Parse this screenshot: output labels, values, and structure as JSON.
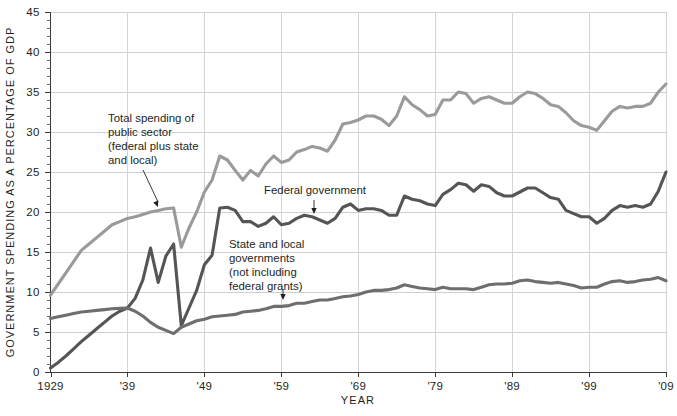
{
  "chart_data": {
    "type": "line",
    "title": "",
    "xlabel": "YEAR",
    "ylabel": "GOVERNMENT SPENDING AS A PERCENTAGE OF GDP",
    "xlim": [
      1929,
      2009
    ],
    "ylim": [
      0,
      45
    ],
    "ytick_step": 5,
    "yminor_step": 1,
    "grid": "horizontal-and-vertical",
    "legend_position": "inline-annotations",
    "ytick_labels": [
      "0",
      "5",
      "10",
      "15",
      "20",
      "25",
      "30",
      "35",
      "40",
      "45"
    ],
    "xtick_values": [
      1929,
      1939,
      1949,
      1959,
      1969,
      1979,
      1989,
      1999,
      2009
    ],
    "xtick_labels": [
      "1929",
      "'39",
      "'49",
      "'59",
      "'69",
      "'79",
      "'89",
      "'99",
      "'09"
    ],
    "x": [
      1929,
      1930,
      1931,
      1932,
      1933,
      1934,
      1935,
      1936,
      1937,
      1938,
      1939,
      1940,
      1941,
      1942,
      1943,
      1944,
      1945,
      1946,
      1947,
      1948,
      1949,
      1950,
      1951,
      1952,
      1953,
      1954,
      1955,
      1956,
      1957,
      1958,
      1959,
      1960,
      1961,
      1962,
      1963,
      1964,
      1965,
      1966,
      1967,
      1968,
      1969,
      1970,
      1971,
      1972,
      1973,
      1974,
      1975,
      1976,
      1977,
      1978,
      1979,
      1980,
      1981,
      1982,
      1983,
      1984,
      1985,
      1986,
      1987,
      1988,
      1989,
      1990,
      1991,
      1992,
      1993,
      1994,
      1995,
      1996,
      1997,
      1998,
      1999,
      2000,
      2001,
      2002,
      2003,
      2004,
      2005,
      2006,
      2007,
      2008,
      2009
    ],
    "series": [
      {
        "name": "Total spending of public sector (federal plus state and local)",
        "color": "#9a9a9a",
        "values": [
          9.6,
          11.0,
          12.4,
          13.8,
          15.2,
          16.0,
          16.8,
          17.6,
          18.4,
          18.8,
          19.2,
          19.4,
          19.7,
          20.0,
          20.2,
          20.4,
          20.5,
          15.6,
          18.0,
          20.0,
          22.5,
          24.0,
          27.0,
          26.5,
          25.2,
          24.0,
          25.2,
          24.5,
          26.0,
          27.0,
          26.2,
          26.5,
          27.5,
          27.8,
          28.2,
          28.0,
          27.6,
          29.0,
          31.0,
          31.2,
          31.5,
          32.0,
          32.0,
          31.6,
          30.8,
          32.0,
          34.4,
          33.4,
          32.8,
          32.0,
          32.2,
          34.0,
          34.0,
          35.0,
          34.8,
          33.6,
          34.2,
          34.4,
          34.0,
          33.6,
          33.6,
          34.4,
          35.0,
          34.8,
          34.2,
          33.4,
          33.2,
          32.4,
          31.4,
          30.8,
          30.6,
          30.2,
          31.4,
          32.6,
          33.2,
          33.0,
          33.2,
          33.2,
          33.6,
          35.0,
          36.0
        ]
      },
      {
        "name": "Federal government",
        "color": "#555555",
        "values": [
          0.5,
          1.2,
          2.0,
          2.9,
          3.8,
          4.6,
          5.4,
          6.2,
          7.0,
          7.6,
          8.0,
          9.2,
          11.5,
          15.5,
          11.2,
          14.5,
          16.0,
          5.8,
          8.0,
          10.2,
          13.4,
          14.6,
          20.5,
          20.6,
          20.2,
          18.8,
          18.8,
          18.2,
          18.6,
          19.4,
          18.4,
          18.6,
          19.2,
          19.6,
          19.4,
          19.0,
          18.6,
          19.2,
          20.6,
          21.0,
          20.2,
          20.4,
          20.4,
          20.2,
          19.6,
          19.6,
          22.0,
          21.6,
          21.4,
          21.0,
          20.8,
          22.2,
          22.8,
          23.6,
          23.4,
          22.6,
          23.4,
          23.2,
          22.4,
          22.0,
          22.0,
          22.5,
          23.0,
          23.0,
          22.4,
          21.8,
          21.6,
          20.2,
          19.8,
          19.4,
          19.4,
          18.6,
          19.2,
          20.2,
          20.8,
          20.6,
          20.8,
          20.6,
          21.0,
          22.6,
          25.0
        ]
      },
      {
        "name": "State and local governments (not including federal grants)",
        "color": "#6e6e6e",
        "values": [
          6.7,
          6.9,
          7.1,
          7.3,
          7.5,
          7.6,
          7.7,
          7.8,
          7.9,
          7.95,
          8.0,
          7.6,
          7.0,
          6.2,
          5.6,
          5.2,
          4.8,
          5.6,
          6.0,
          6.4,
          6.6,
          6.9,
          7.0,
          7.1,
          7.2,
          7.5,
          7.6,
          7.7,
          7.9,
          8.2,
          8.2,
          8.3,
          8.6,
          8.6,
          8.8,
          9.0,
          9.0,
          9.2,
          9.4,
          9.5,
          9.7,
          10.0,
          10.2,
          10.2,
          10.3,
          10.5,
          10.9,
          10.7,
          10.5,
          10.4,
          10.3,
          10.6,
          10.4,
          10.4,
          10.4,
          10.3,
          10.6,
          10.9,
          11.0,
          11.0,
          11.1,
          11.4,
          11.5,
          11.3,
          11.2,
          11.1,
          11.2,
          11.0,
          10.8,
          10.5,
          10.6,
          10.6,
          11.0,
          11.3,
          11.4,
          11.2,
          11.3,
          11.5,
          11.6,
          11.8,
          11.4
        ]
      }
    ],
    "annotations": [
      {
        "id": "total-spending",
        "lines": [
          "Total spending of",
          "public sector",
          "(federal plus state",
          "and local)"
        ],
        "text_x": 108,
        "text_y": 122,
        "leader": {
          "x1": 143,
          "y1": 170,
          "x2": 158,
          "y2": 207
        }
      },
      {
        "id": "federal-government",
        "lines": [
          "Federal government"
        ],
        "text_x": 264,
        "text_y": 194,
        "leader": {
          "x1": 314,
          "y1": 200,
          "x2": 314,
          "y2": 214
        }
      },
      {
        "id": "state-and-local",
        "lines": [
          "State and local",
          "governments",
          "(not including",
          "federal grants)"
        ],
        "text_x": 229,
        "text_y": 248,
        "leader": {
          "x1": 283,
          "y1": 289,
          "x2": 283,
          "y2": 300
        }
      }
    ]
  }
}
